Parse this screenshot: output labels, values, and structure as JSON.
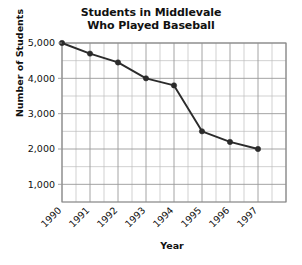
{
  "chart_data": {
    "type": "line",
    "title": "Students in Middlevale Who Played Baseball",
    "title_lines": [
      "Students in Middlevale",
      "Who Played Baseball"
    ],
    "xlabel": "Year",
    "ylabel": "Number of Students",
    "categories": [
      "1990",
      "1991",
      "1992",
      "1993",
      "1994",
      "1995",
      "1996",
      "1997"
    ],
    "values": [
      5000,
      4700,
      4450,
      4000,
      3800,
      2500,
      2200,
      2000
    ],
    "ylim": [
      0,
      5000
    ],
    "ytick_labels": [
      "5,000",
      "4,000",
      "3,000",
      "2,000",
      "1,000"
    ],
    "ytick_values": [
      5000,
      4000,
      3000,
      2000,
      1000
    ],
    "y_minor_step": 500,
    "x_minor_per_category": 2,
    "grid": true,
    "legend": "none",
    "marker": "filled-circle",
    "series_color": "#2b2b2b",
    "grid_color": "#9a9a9a",
    "frame_color": "#8a8a8a",
    "background": "#ffffff"
  }
}
